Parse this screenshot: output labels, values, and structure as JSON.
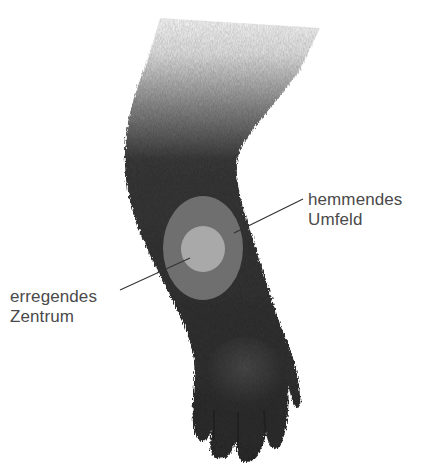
{
  "figure": {
    "colors": {
      "fur": "#2f2f2f",
      "fur_light": "#4a4a4a",
      "surround": "#6e6e6e",
      "center": "#a7a7a7",
      "line": "#333333",
      "text": "#4a4a4a",
      "background": "#ffffff"
    },
    "receptive_field": {
      "outer": {
        "cx": 203,
        "cy": 248,
        "rx": 40,
        "ry": 52
      },
      "inner": {
        "cx": 203,
        "cy": 249,
        "rx": 22,
        "ry": 23
      }
    }
  },
  "labels": {
    "surround": {
      "line1": "hemmendes",
      "line2": "Umfeld"
    },
    "center": {
      "line1": "erregendes",
      "line2": "Zentrum"
    }
  }
}
